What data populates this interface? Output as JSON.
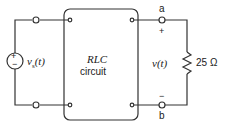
{
  "diagram": {
    "type": "circuit",
    "source": {
      "symbol": "v",
      "subscript": "s",
      "arg": "(t)",
      "plus": "+",
      "minus": "−"
    },
    "box": {
      "title": "RLC",
      "subtitle": "circuit"
    },
    "terminals": {
      "top": "a",
      "bottom": "b",
      "plus": "+",
      "minus": "−"
    },
    "output_voltage": "v(t)",
    "resistor": {
      "value": "25 Ω"
    },
    "colors": {
      "wire": "#333333",
      "text": "#222222"
    }
  }
}
